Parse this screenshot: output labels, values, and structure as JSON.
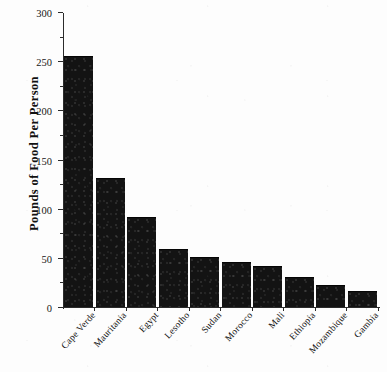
{
  "chart_data": {
    "type": "bar",
    "title": "",
    "xlabel": "",
    "ylabel": "Pounds of Food Per Person",
    "ylim": [
      0,
      300
    ],
    "ytick_major_step": 50,
    "ytick_minor_step": 25,
    "grid": false,
    "legend": false,
    "bar_color": "#131313",
    "axis_color": "#2b2b2b",
    "background": "#fdfdfd",
    "ytick_labels": [
      "0",
      "50",
      "100",
      "150",
      "200",
      "250",
      "300"
    ],
    "ytick_values": [
      0,
      50,
      100,
      150,
      200,
      250,
      300
    ],
    "yminor_values": [
      25,
      75,
      125,
      175,
      225,
      275
    ],
    "categories": [
      "Cape Verde",
      "Mauritania",
      "Egypt",
      "Lesotho",
      "Sudan",
      "Morocco",
      "Mali",
      "Ethiopia",
      "Mozambique",
      "Gambia"
    ],
    "values": [
      254,
      130,
      91,
      58,
      50,
      45,
      41,
      30,
      21,
      15
    ]
  }
}
